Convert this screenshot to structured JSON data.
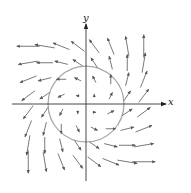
{
  "diagram": {
    "type": "vector_field",
    "field_formula": "F(x, y) = (x - y, x + y)",
    "axes": {
      "x_label": "x",
      "y_label": "y",
      "origin_px": [
        86,
        104
      ],
      "x_axis_px": [
        12,
        166
      ],
      "y_axis_px": [
        24,
        181
      ],
      "unit_px": 16.5
    },
    "circle": {
      "center": [
        0,
        0
      ],
      "radius": 2.3,
      "color": "#a8a8a8"
    },
    "arrow_color": "#555555",
    "axis_color": "#333333",
    "arrow_scale_px_per_unit": 3.3,
    "grid_values": [
      -3.5,
      -2.5,
      -1.5,
      -0.5,
      0.5,
      1.5,
      2.5,
      3.5
    ]
  }
}
